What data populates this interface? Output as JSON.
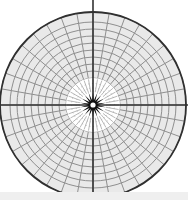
{
  "figure": {
    "width": 188,
    "height": 200,
    "background_color": "#ffffff",
    "bottom_band_color": "#efefef",
    "bottom_band_height": 8
  },
  "chart_data": {
    "type": "scatter",
    "subtitle": "",
    "xlabel": "",
    "ylabel": "",
    "grid": true,
    "legend_position": "none",
    "projection": "polar",
    "center": {
      "x": 93,
      "y": 105
    },
    "outer_radius": 93,
    "clipped_edges": [
      "left",
      "right",
      "bottom"
    ],
    "spokes": {
      "count": 36,
      "angle_step_degrees": 10,
      "angles_degrees": [
        0,
        10,
        20,
        30,
        40,
        50,
        60,
        70,
        80,
        90,
        100,
        110,
        120,
        130,
        140,
        150,
        160,
        170,
        180,
        190,
        200,
        210,
        220,
        230,
        240,
        250,
        260,
        270,
        280,
        290,
        300,
        310,
        320,
        330,
        340,
        350
      ],
      "color": "#8f8f8f",
      "stroke_width": 1.0,
      "inner_start_radius": 13
    },
    "rings": {
      "count": 12,
      "radii": [
        13,
        20,
        27,
        34,
        41,
        48,
        55,
        62,
        69,
        76,
        83,
        93
      ],
      "color": "#8f8f8f",
      "stroke_width": 1.0
    },
    "fill": {
      "disc_color": "#e9e9e9",
      "inner_gap_color": "#ffffff",
      "inner_gap_radius": 27
    },
    "axes": {
      "horizontal_y": 105,
      "vertical_x": 93,
      "color": "#333333",
      "stroke_width": 1.6
    },
    "outer_boundary": {
      "radius": 93,
      "color": "#303030",
      "stroke_width": 1.8
    },
    "center_rosette": {
      "outer_radius": 13,
      "inner_radius": 4.5,
      "tooth_count": 18,
      "color": "#101010",
      "hole_color": "#ffffff",
      "hole_radius": 2.6
    },
    "inner_spoke_band": {
      "start_radius": 13,
      "end_radius": 26,
      "count": 36,
      "color": "#9a9a9a",
      "stroke_width": 0.7
    },
    "colors": {
      "disc_fill": "#e9e9e9",
      "gridline": "#8f8f8f",
      "axis": "#333333",
      "boundary": "#303030",
      "rosette": "#101010",
      "gap": "#ffffff",
      "band": "#efefef"
    }
  }
}
